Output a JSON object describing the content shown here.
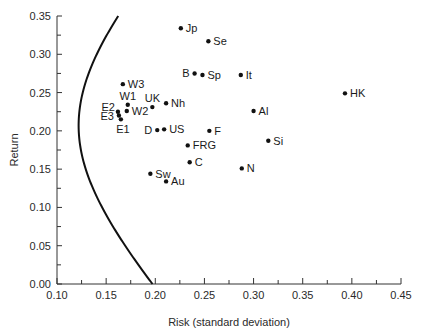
{
  "chart_data": {
    "type": "scatter",
    "title": "",
    "xlabel": "Risk (standard deviation)",
    "ylabel": "Return",
    "xlim": [
      0.1,
      0.45
    ],
    "ylim": [
      0.0,
      0.35
    ],
    "x_ticks": [
      "0.10",
      "0.15",
      "0.20",
      "0.25",
      "0.30",
      "0.35",
      "0.40",
      "0.45"
    ],
    "y_ticks": [
      "0.00",
      "0.05",
      "0.10",
      "0.15",
      "0.20",
      "0.25",
      "0.30",
      "0.35"
    ],
    "grid": false,
    "legend": null,
    "points": [
      {
        "label": "Jp",
        "x": 0.226,
        "y": 0.334,
        "label_pos": "right"
      },
      {
        "label": "Se",
        "x": 0.254,
        "y": 0.317,
        "label_pos": "right"
      },
      {
        "label": "B",
        "x": 0.24,
        "y": 0.275,
        "label_pos": "left"
      },
      {
        "label": "Sp",
        "x": 0.248,
        "y": 0.273,
        "label_pos": "right"
      },
      {
        "label": "It",
        "x": 0.287,
        "y": 0.273,
        "label_pos": "right"
      },
      {
        "label": "HK",
        "x": 0.393,
        "y": 0.249,
        "label_pos": "right"
      },
      {
        "label": "Al",
        "x": 0.3,
        "y": 0.226,
        "label_pos": "right"
      },
      {
        "label": "Si",
        "x": 0.315,
        "y": 0.187,
        "label_pos": "right"
      },
      {
        "label": "N",
        "x": 0.288,
        "y": 0.151,
        "label_pos": "right"
      },
      {
        "label": "W3",
        "x": 0.167,
        "y": 0.261,
        "label_pos": "right"
      },
      {
        "label": "W1",
        "x": 0.172,
        "y": 0.234,
        "label_pos": "above"
      },
      {
        "label": "W2",
        "x": 0.171,
        "y": 0.226,
        "label_pos": "right"
      },
      {
        "label": "UK",
        "x": 0.197,
        "y": 0.231,
        "label_pos": "above"
      },
      {
        "label": "Nh",
        "x": 0.211,
        "y": 0.236,
        "label_pos": "right"
      },
      {
        "label": "E2",
        "x": 0.162,
        "y": 0.225,
        "label_pos": "above-left"
      },
      {
        "label": "E3",
        "x": 0.163,
        "y": 0.22,
        "label_pos": "left"
      },
      {
        "label": "E1",
        "x": 0.165,
        "y": 0.215,
        "label_pos": "below"
      },
      {
        "label": "D",
        "x": 0.202,
        "y": 0.201,
        "label_pos": "left"
      },
      {
        "label": "US",
        "x": 0.209,
        "y": 0.202,
        "label_pos": "right"
      },
      {
        "label": "F",
        "x": 0.255,
        "y": 0.2,
        "label_pos": "right"
      },
      {
        "label": "FRG",
        "x": 0.233,
        "y": 0.181,
        "label_pos": "right"
      },
      {
        "label": "C",
        "x": 0.235,
        "y": 0.159,
        "label_pos": "right"
      },
      {
        "label": "Sw",
        "x": 0.195,
        "y": 0.144,
        "label_pos": "right"
      },
      {
        "label": "Au",
        "x": 0.211,
        "y": 0.134,
        "label_pos": "right"
      }
    ],
    "frontier": {
      "description": "Minimum-variance frontier (hyperbola)",
      "min_variance_point": {
        "x": 0.122,
        "y": 0.207
      },
      "curvature": 0.56,
      "y_range": [
        0.0,
        0.35
      ]
    },
    "colors": {
      "points": "#111111",
      "curve": "#111111",
      "axis": "#333333"
    }
  }
}
